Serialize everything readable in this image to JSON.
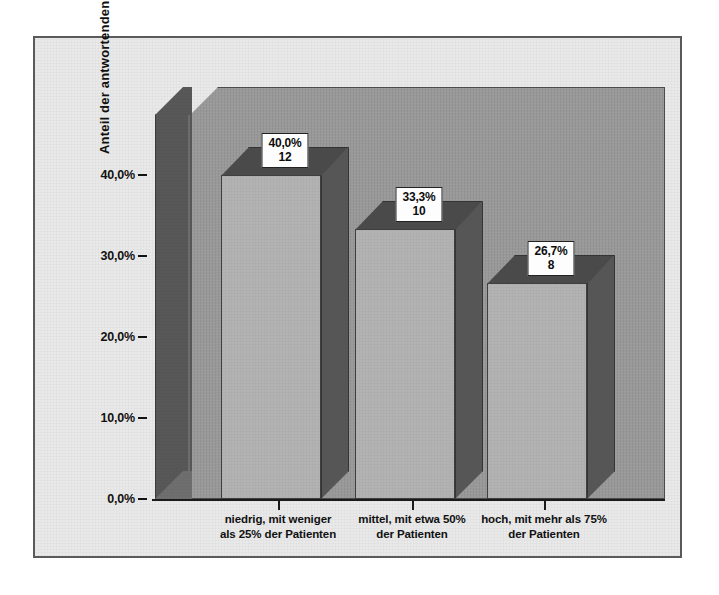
{
  "chart_data": {
    "type": "bar",
    "title": "",
    "subtitle": "",
    "xlabel": "",
    "ylabel": "Anteil der antwortenden Mitarbeiter",
    "ylim": [
      0,
      45
    ],
    "ytick_labels": [
      "0,0%",
      "10,0%",
      "20,0%",
      "30,0%",
      "40,0%"
    ],
    "ytick_values": [
      0,
      10,
      20,
      30,
      40
    ],
    "grid": false,
    "legend": null,
    "categories": [
      "niedrig, mit weniger als 25% der Patienten",
      "mittel, mit etwa 50% der Patienten",
      "hoch, mit mehr als 75% der Patienten"
    ],
    "category_lines": [
      [
        "niedrig, mit weniger",
        "als 25% der Patienten"
      ],
      [
        "mittel, mit etwa 50%",
        "der Patienten"
      ],
      [
        "hoch, mit mehr als 75%",
        "der Patienten"
      ]
    ],
    "values": [
      40.0,
      33.3,
      26.7
    ],
    "counts": [
      12,
      10,
      8
    ],
    "value_labels": [
      "40,0%",
      "33,3%",
      "26,7%"
    ],
    "count_labels": [
      "12",
      "10",
      "8"
    ],
    "style": {
      "bar_face_color": "#b3b3b3",
      "bar_side_color": "#565656",
      "bar_top_color": "#4a4a4a",
      "back_wall_color": "#9d9d9d",
      "side_wall_color": "#585858",
      "frame_background": "#e9e9e9",
      "frame_border_color": "#5a5a5a",
      "label_box_background": "#fdfdfd",
      "text_color": "#111111"
    }
  },
  "axis": {
    "y_title": "Anteil der antwortenden Mitarbeiter"
  }
}
